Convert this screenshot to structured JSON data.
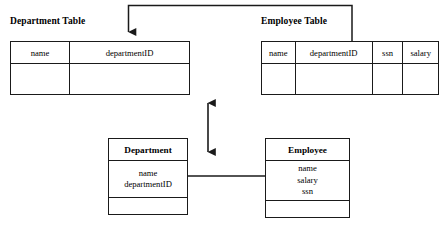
{
  "diagram": {
    "tables": [
      {
        "title": "Department Table",
        "columns": [
          "name",
          "departmentID"
        ],
        "rows": [
          [
            "",
            ""
          ]
        ]
      },
      {
        "title": "Employee Table",
        "columns": [
          "name",
          "departmentID",
          "ssn",
          "salary"
        ],
        "rows": [
          [
            "",
            "",
            "",
            ""
          ]
        ]
      }
    ],
    "classes": [
      {
        "name": "Department",
        "attributes": [
          "name",
          "departmentID"
        ],
        "operations": []
      },
      {
        "name": "Employee",
        "attributes": [
          "name",
          "salary",
          "ssn"
        ],
        "operations": []
      }
    ],
    "connectors": [
      {
        "name": "employee-departmentid-to-department-departmentid",
        "style": "elbow-arrow",
        "arrowheads": "end"
      },
      {
        "name": "department-class-to-employee-class",
        "style": "plain-line",
        "arrowheads": "none"
      },
      {
        "name": "tables-to-classes-mapping",
        "style": "vertical-double-arrow",
        "arrowheads": "both"
      }
    ],
    "colors": {
      "stroke": "#1a1a1a",
      "background": "#ffffff",
      "text": "#000000"
    }
  }
}
